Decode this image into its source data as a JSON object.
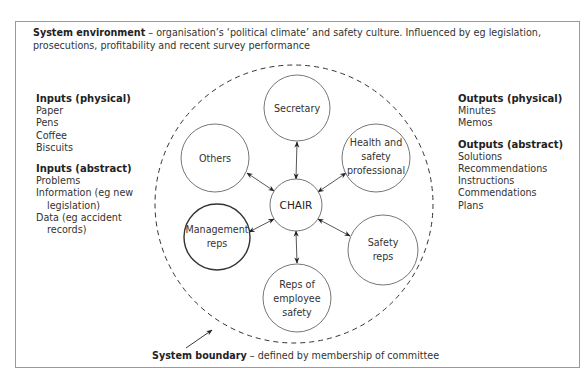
{
  "environment": {
    "label": "System environment",
    "description": " – organisation’s ‘political climate’ and safety culture. Influenced by eg legislation, prosecutions, profitability and recent survey performance"
  },
  "inputs": {
    "physical": {
      "heading": "Inputs (physical)",
      "items": [
        "Paper",
        "Pens",
        "Coffee",
        "Biscuits"
      ]
    },
    "abstract": {
      "heading": "Inputs (abstract)",
      "items": [
        "Problems",
        "Information (eg new",
        "legislation)",
        "Data (eg accident",
        "records)"
      ]
    }
  },
  "outputs": {
    "physical": {
      "heading": "Outputs (physical)",
      "items": [
        "Minutes",
        "Memos"
      ]
    },
    "abstract": {
      "heading": "Outputs (abstract)",
      "items": [
        "Solutions",
        "Recommendations",
        "Instructions",
        "Commendations",
        "Plans"
      ]
    }
  },
  "diagram": {
    "center": {
      "label": "CHAIR"
    },
    "nodes": [
      {
        "id": "secretary",
        "lines": [
          "Secretary"
        ]
      },
      {
        "id": "health-safety",
        "lines": [
          "Health and",
          "safety",
          "professional"
        ]
      },
      {
        "id": "safety-reps",
        "lines": [
          "Safety",
          "reps"
        ]
      },
      {
        "id": "employee-reps",
        "lines": [
          "Reps of",
          "employee",
          "safety"
        ]
      },
      {
        "id": "management-reps",
        "lines": [
          "Management",
          "reps"
        ]
      },
      {
        "id": "others",
        "lines": [
          "Others"
        ]
      }
    ]
  },
  "boundary": {
    "label": "System boundary",
    "description": " – defined by membership of committee"
  }
}
